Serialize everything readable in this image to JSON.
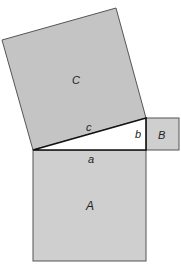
{
  "diagram": {
    "colors": {
      "square_fill": "#cccccc",
      "square_C_fill": "#c4c4c4",
      "triangle_fill": "#ffffff",
      "stroke": "#222222"
    },
    "labels": {
      "square_A": "A",
      "square_B": "B",
      "square_C": "C",
      "side_a": "a",
      "side_b": "b",
      "side_c": "c"
    }
  }
}
